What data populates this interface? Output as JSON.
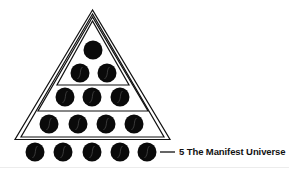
{
  "diagram": {
    "colors": {
      "line": "#111111",
      "circle": "#0a0a0a",
      "background": "#ffffff",
      "highlight": "#5a5a5a"
    },
    "triangles": [
      {
        "name": "outer-triangle",
        "apex": [
          92.5,
          10
        ],
        "left": [
          15,
          139.5
        ],
        "right": [
          170,
          139.5
        ]
      },
      {
        "name": "outer-triangle-inner-line",
        "apex": [
          92.5,
          14
        ],
        "left": [
          21,
          137
        ],
        "right": [
          164,
          137
        ]
      },
      {
        "name": "middle-triangle",
        "apex": [
          92.5,
          17
        ],
        "left": [
          38,
          111
        ],
        "right": [
          148,
          111
        ]
      },
      {
        "name": "inner-triangle",
        "apex": [
          92.5,
          21
        ],
        "left": [
          57,
          85
        ],
        "right": [
          129,
          85
        ]
      }
    ],
    "rows": [
      {
        "level": 1,
        "count": 1,
        "y": 50,
        "x": [
          93
        ]
      },
      {
        "level": 2,
        "count": 2,
        "y": 73,
        "x": [
          80,
          107
        ]
      },
      {
        "level": 3,
        "count": 3,
        "y": 97,
        "x": [
          65,
          92,
          120
        ]
      },
      {
        "level": 4,
        "count": 4,
        "y": 124,
        "x": [
          49,
          78,
          106,
          134
        ]
      },
      {
        "level": 5,
        "count": 5,
        "y": 152,
        "x": [
          35,
          63,
          92,
          120,
          147
        ]
      }
    ],
    "circle_radius": 9.5,
    "callout": {
      "line": {
        "x1": 160,
        "x2": 175,
        "y": 152
      },
      "text": "5 The Manifest Universe"
    }
  }
}
